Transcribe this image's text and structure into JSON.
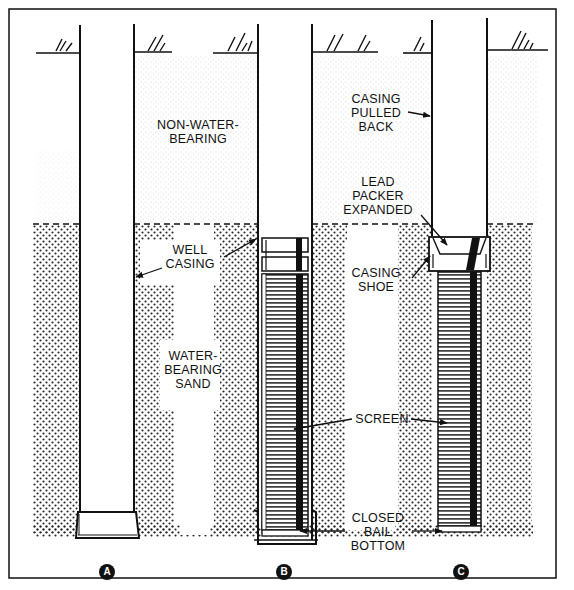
{
  "diagram": {
    "type": "well screen installation by pull-back method",
    "panels": [
      {
        "id": "A",
        "badge": "A"
      },
      {
        "id": "B",
        "badge": "B"
      },
      {
        "id": "C",
        "badge": "C"
      }
    ],
    "labels": {
      "non_water_bearing": [
        "NON-WATER-",
        "BEARING"
      ],
      "well_casing": [
        "WELL",
        "CASING"
      ],
      "water_bearing_sand": [
        "WATER-",
        "BEARING",
        "SAND"
      ],
      "casing_pulled_back": [
        "CASING",
        "PULLED",
        "BACK"
      ],
      "lead_packer_expanded": [
        "LEAD",
        "PACKER",
        "EXPANDED"
      ],
      "casing_shoe": [
        "CASING",
        "SHOE"
      ],
      "screen": "SCREEN",
      "closed_bail_bottom": [
        "CLOSED",
        "BAIL",
        "BOTTOM"
      ]
    },
    "colors": {
      "ink": "#111111",
      "paper": "#ffffff",
      "sand_dot": "#222222"
    }
  }
}
